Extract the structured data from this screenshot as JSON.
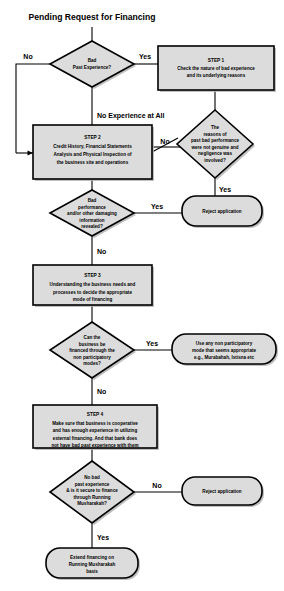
{
  "diagram": {
    "title": "Pending Request for Financing",
    "colors": {
      "node_fill": "#dcdcdc",
      "node_stroke": "#000000",
      "shadow": "#b4b4b4",
      "background": "#ffffff",
      "text": "#000000"
    }
  },
  "nodes": {
    "start_title": {
      "kind": "title",
      "label": "Pending Request for Financing"
    },
    "bad_past_experience": {
      "kind": "decision",
      "lines": [
        "Bad",
        "Past Experience?"
      ]
    },
    "step1": {
      "kind": "process",
      "heading": "STEP 1",
      "lines": [
        "Check the nature of bad experience",
        "and its underlying reasons"
      ]
    },
    "reasons_not_genuine": {
      "kind": "decision",
      "lines": [
        "The",
        "reasons of",
        "past bad performance",
        "were not genuine and",
        "negligence was",
        "involved?"
      ]
    },
    "reject_application_1": {
      "kind": "terminator",
      "lines": [
        "Reject application"
      ]
    },
    "step2": {
      "kind": "process",
      "heading": "STEP 2",
      "lines": [
        "Credit History, Financial Statements",
        "Analysis and Physical Inspection of",
        "the business site and operations"
      ]
    },
    "bad_performance_revealed": {
      "kind": "decision",
      "lines": [
        "Bad",
        "performance",
        "and/or other damaging",
        "information",
        "revealed?"
      ]
    },
    "step3": {
      "kind": "process",
      "heading": "STEP 3",
      "lines": [
        "Understanding the business needs and",
        "processes to decide the appropriate",
        "mode of financing"
      ]
    },
    "non_participatory_modes": {
      "kind": "decision",
      "lines": [
        "Can the",
        "business be",
        "financed through the",
        "non participatory",
        "modes?"
      ]
    },
    "use_non_participatory": {
      "kind": "terminator",
      "lines": [
        "Use any non participatory",
        "mode that seems appropriate",
        "e.g., Murabahah, Istisna etc"
      ]
    },
    "step4": {
      "kind": "process",
      "heading": "STEP 4",
      "lines": [
        "Make sure that business is cooperative",
        "and has enough experience in utilizing",
        "external financing. And that bank does",
        "not have bad past experience with them"
      ]
    },
    "secure_running_musharakah": {
      "kind": "decision",
      "lines": [
        "No bad",
        "past experience",
        "& is it secure to finance",
        "through Running",
        "Musharakah?"
      ]
    },
    "reject_application_2": {
      "kind": "terminator",
      "lines": [
        "Reject application"
      ]
    },
    "extend_financing": {
      "kind": "terminator",
      "lines": [
        "Extend financing on",
        "Running Musharakah",
        "basis"
      ]
    }
  },
  "edge_labels": {
    "bad_experience_no": "No",
    "bad_experience_yes": "Yes",
    "no_experience_at_all": "No Experience at All",
    "reasons_yes": "Yes",
    "step2_to_reasons_no": "No",
    "bad_performance_yes": "Yes",
    "bad_performance_no": "No",
    "non_participatory_yes": "Yes",
    "non_participatory_no": "No",
    "musharakah_no": "No",
    "musharakah_yes": "Yes"
  }
}
